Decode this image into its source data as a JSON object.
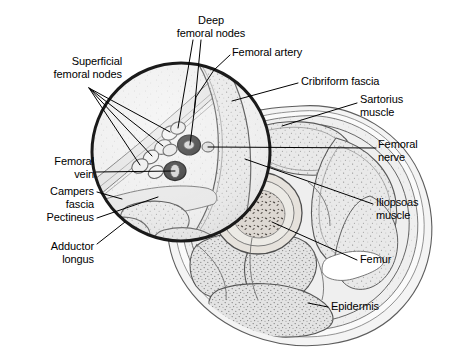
{
  "figure": {
    "width": 451,
    "height": 353,
    "background_color": "#ffffff",
    "ink_color": "#000000",
    "style": "grayscale pen-and-ink medical illustration with stippled muscle texture"
  },
  "inset": {
    "name": "magnifier-circle",
    "center_x": 181,
    "center_y": 152,
    "radius": 91,
    "stroke_color": "#1a1a1a",
    "stroke_width": 3
  },
  "labels": [
    {
      "id": "deep-femoral-nodes",
      "text": "Deep\nfemoral nodes",
      "lines": [
        "Deep",
        "femoral nodes"
      ],
      "x": 163,
      "y": 14,
      "width": 96,
      "align": "center",
      "leaders": [
        [
          [
            193,
            40
          ],
          [
            178,
            128
          ]
        ],
        [
          [
            201,
            40
          ],
          [
            194,
            113
          ]
        ]
      ]
    },
    {
      "id": "femoral-artery",
      "text": "Femoral artery",
      "lines": [
        "Femoral artery"
      ],
      "x": 232,
      "y": 46,
      "width": 90,
      "align": "left",
      "leaders": [
        [
          [
            230,
            55
          ],
          [
            214,
            70
          ],
          [
            196,
            97
          ],
          [
            190,
            145
          ]
        ]
      ]
    },
    {
      "id": "superficial-femoral-nodes",
      "text": "Superficial\nfemoral nodes",
      "lines": [
        "Superficial",
        "femoral nodes"
      ],
      "x": 26,
      "y": 55,
      "width": 96,
      "align": "right",
      "leaders": [
        [
          [
            89,
            88
          ],
          [
            170,
            132
          ]
        ],
        [
          [
            89,
            88
          ],
          [
            163,
            146
          ]
        ],
        [
          [
            89,
            88
          ],
          [
            152,
            156
          ]
        ],
        [
          [
            89,
            88
          ],
          [
            140,
            165
          ]
        ]
      ]
    },
    {
      "id": "cribriform-fascia",
      "text": "Cribriform fascia",
      "lines": [
        "Cribriform fascia"
      ],
      "x": 301,
      "y": 75,
      "width": 100,
      "align": "left",
      "leaders": [
        [
          [
            298,
            83
          ],
          [
            232,
            101
          ]
        ]
      ]
    },
    {
      "id": "sartorius-muscle",
      "text": "Sartorius\nmuscle",
      "lines": [
        "Sartorius",
        "muscle"
      ],
      "x": 360,
      "y": 93,
      "width": 70,
      "align": "left",
      "leaders": [
        [
          [
            357,
            103
          ],
          [
            282,
            126
          ]
        ]
      ]
    },
    {
      "id": "femoral-nerve",
      "text": "Femoral\nnerve",
      "lines": [
        "Femoral",
        "nerve"
      ],
      "x": 378,
      "y": 138,
      "width": 66,
      "align": "left",
      "leaders": [
        [
          [
            376,
            148
          ],
          [
            208,
            147
          ]
        ]
      ]
    },
    {
      "id": "femoral-vein",
      "text": "Femoral\nvein",
      "lines": [
        "Femoral",
        "vein"
      ],
      "x": 18,
      "y": 155,
      "width": 76,
      "align": "right",
      "leaders": [
        [
          [
            96,
            172
          ],
          [
            175,
            171
          ]
        ]
      ]
    },
    {
      "id": "campers-fascia",
      "text": "Campers\nfascia",
      "lines": [
        "Campers",
        "fascia"
      ],
      "x": 14,
      "y": 185,
      "width": 80,
      "align": "right",
      "leaders": [
        [
          [
            97,
            192
          ],
          [
            122,
            199
          ]
        ]
      ]
    },
    {
      "id": "iliopsoas-muscle",
      "text": "Iliopsoas\nmuscle",
      "lines": [
        "Iliopsoas",
        "muscle"
      ],
      "x": 376,
      "y": 196,
      "width": 70,
      "align": "left",
      "leaders": [
        [
          [
            373,
            204
          ],
          [
            245,
            159
          ]
        ]
      ]
    },
    {
      "id": "pectineus",
      "text": "Pectineus",
      "lines": [
        "Pectineus"
      ],
      "x": 20,
      "y": 211,
      "width": 74,
      "align": "right",
      "leaders": [
        [
          [
            97,
            218
          ],
          [
            158,
            197
          ]
        ]
      ]
    },
    {
      "id": "adductor-longus",
      "text": "Adductor\nlongus",
      "lines": [
        "Adductor",
        "longus"
      ],
      "x": 20,
      "y": 240,
      "width": 74,
      "align": "right",
      "leaders": [
        [
          [
            97,
            244
          ],
          [
            125,
            222
          ]
        ]
      ]
    },
    {
      "id": "femur",
      "text": "Femur",
      "lines": [
        "Femur"
      ],
      "x": 360,
      "y": 253,
      "width": 50,
      "align": "left",
      "leaders": [
        [
          [
            357,
            260
          ],
          [
            272,
            222
          ]
        ]
      ]
    },
    {
      "id": "epidermis",
      "text": "Epidermis",
      "lines": [
        "Epidermis"
      ],
      "x": 331,
      "y": 300,
      "width": 70,
      "align": "left",
      "leaders": [
        [
          [
            328,
            307
          ],
          [
            308,
            303
          ]
        ]
      ]
    }
  ],
  "anatomy": {
    "structures": [
      "Superficial femoral nodes",
      "Deep femoral nodes",
      "Femoral artery",
      "Femoral vein",
      "Femoral nerve",
      "Cribriform fascia",
      "Campers fascia",
      "Sartorius muscle",
      "Iliopsoas muscle",
      "Pectineus",
      "Adductor longus",
      "Femur",
      "Epidermis"
    ]
  }
}
